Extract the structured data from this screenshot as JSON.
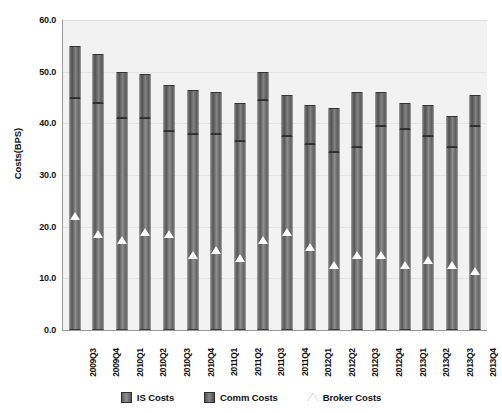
{
  "chart_data": {
    "type": "bar",
    "title": "",
    "subtitle": "",
    "xlabel": "",
    "ylabel": "Costs(BPS)",
    "ylim": [
      0.0,
      60.0
    ],
    "ytick_step": 10.0,
    "ytick_labels": [
      "60.0",
      "50.0",
      "40.0",
      "30.0",
      "20.0",
      "10.0",
      "0.0"
    ],
    "ytick_values": [
      60.0,
      50.0,
      40.0,
      30.0,
      20.0,
      10.0,
      0.0
    ],
    "grid": true,
    "grid_axis": "y",
    "stacked": true,
    "legend_position": "bottom",
    "categories": [
      "2009Q3",
      "2009Q4",
      "2010Q1",
      "2010Q2",
      "2010Q3",
      "2010Q4",
      "2011Q1",
      "2011Q2",
      "2011Q3",
      "2011Q4",
      "2012Q1",
      "2012Q2",
      "2012Q3",
      "2012Q4",
      "2013Q1",
      "2013Q2",
      "2013Q3",
      "2013Q4"
    ],
    "series": [
      {
        "name": "IS Costs",
        "type": "bar-segment",
        "stack_position": "bottom",
        "color": "#6d6d6d",
        "values": [
          45.0,
          44.0,
          41.0,
          41.0,
          38.5,
          38.0,
          38.0,
          36.5,
          44.5,
          37.5,
          36.0,
          34.5,
          35.5,
          39.5,
          39.0,
          37.5,
          35.5,
          39.5
        ]
      },
      {
        "name": "Comm Costs",
        "type": "bar-segment",
        "stack_position": "top",
        "color": "#5a5a5a",
        "values": [
          55.0,
          53.5,
          50.0,
          49.5,
          47.5,
          46.5,
          46.0,
          44.0,
          50.0,
          45.5,
          43.5,
          43.0,
          46.0,
          46.0,
          44.0,
          43.5,
          41.5,
          45.5
        ]
      },
      {
        "name": "Broker Costs",
        "type": "scatter",
        "marker": "triangle",
        "color": "#ffffff",
        "values": [
          22.0,
          18.5,
          17.5,
          19.0,
          18.5,
          14.5,
          15.5,
          14.0,
          17.5,
          19.0,
          16.0,
          12.5,
          14.5,
          14.5,
          12.5,
          13.5,
          12.5,
          11.5
        ]
      }
    ],
    "legend": [
      {
        "label": "IS Costs",
        "marker": "square",
        "color": "#6d6d6d"
      },
      {
        "label": "Comm Costs",
        "marker": "square",
        "color": "#5a5a5a"
      },
      {
        "label": "Broker Costs",
        "marker": "triangle",
        "color": "#ffffff"
      }
    ]
  },
  "caption": ""
}
